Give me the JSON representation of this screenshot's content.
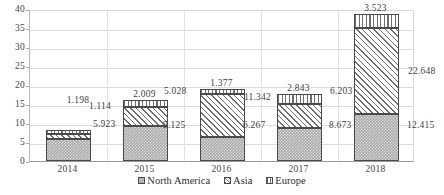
{
  "chart_data": {
    "type": "bar",
    "subtype": "stacked-bar",
    "title": "",
    "xlabel": "",
    "ylabel": "",
    "categories": [
      "2014",
      "2015",
      "2016",
      "2017",
      "2018"
    ],
    "series": [
      {
        "name": "North America",
        "values": [
          5.923,
          9.125,
          6.267,
          8.673,
          12.415
        ],
        "pattern": "dotted-gray",
        "color": "#a9a9a9"
      },
      {
        "name": "Asia",
        "values": [
          1.114,
          5.028,
          11.342,
          6.203,
          22.648
        ],
        "pattern": "diagonal-hatch",
        "color": "#6e6e6e"
      },
      {
        "name": "Europe",
        "values": [
          1.198,
          2.009,
          1.377,
          2.843,
          3.523
        ],
        "pattern": "vertical-stripe",
        "color": "#6e6e6e"
      }
    ],
    "totals": [
      8.235,
      16.162,
      18.986,
      17.719,
      38.586
    ],
    "ylim": [
      0,
      40
    ],
    "yticks": [
      "0",
      "5",
      "10",
      "15",
      "20",
      "25",
      "30",
      "35",
      "40"
    ],
    "grid": "horizontal-and-vertical",
    "legend_position": "bottom-center",
    "data_labels": {
      "2014": {
        "europe": "1.198",
        "asia": "1.114",
        "north_america": "5.923"
      },
      "2015": {
        "europe": "2.009",
        "asia": "5.028",
        "north_america": "9.125"
      },
      "2016": {
        "europe": "1.377",
        "asia": "11.342",
        "north_america": "6.267"
      },
      "2017": {
        "europe": "2.843",
        "asia": "6.203",
        "north_america": "8.673"
      },
      "2018": {
        "europe": "3.523",
        "asia": "22.648",
        "north_america": "12.415"
      }
    }
  },
  "legend": {
    "items": [
      {
        "label": "North America"
      },
      {
        "label": "Asia"
      },
      {
        "label": "Europe"
      }
    ]
  }
}
